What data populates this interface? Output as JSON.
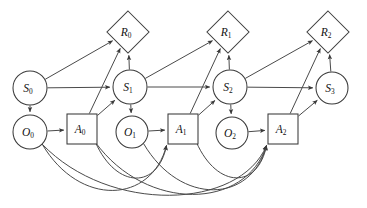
{
  "diagram": {
    "corner_mark": "|",
    "stroke_color": "#4a4a4a",
    "node_fill": "#ffffff",
    "label_color": "#111111",
    "nodes": [
      {
        "id": "S0",
        "base": "S",
        "sub": "0",
        "shape": "circle",
        "cx": 30,
        "cy": 88,
        "r": 17
      },
      {
        "id": "S1",
        "base": "S",
        "sub": "1",
        "shape": "circle",
        "cx": 130,
        "cy": 87,
        "r": 17
      },
      {
        "id": "S2",
        "base": "S",
        "sub": "2",
        "shape": "circle",
        "cx": 230,
        "cy": 87,
        "r": 17
      },
      {
        "id": "S3",
        "base": "S",
        "sub": "3",
        "shape": "circle",
        "cx": 332,
        "cy": 88,
        "r": 16
      },
      {
        "id": "O0",
        "base": "O",
        "sub": "0",
        "shape": "circle",
        "cx": 30,
        "cy": 132,
        "r": 17
      },
      {
        "id": "O1",
        "base": "O",
        "sub": "1",
        "shape": "circle",
        "cx": 132,
        "cy": 132,
        "r": 16
      },
      {
        "id": "O2",
        "base": "O",
        "sub": "2",
        "shape": "circle",
        "cx": 232,
        "cy": 133,
        "r": 16
      },
      {
        "id": "A0",
        "base": "A",
        "sub": "0",
        "shape": "square",
        "cx": 82,
        "cy": 129,
        "r": 15
      },
      {
        "id": "A1",
        "base": "A",
        "sub": "1",
        "shape": "square",
        "cx": 183,
        "cy": 129,
        "r": 15
      },
      {
        "id": "A2",
        "base": "A",
        "sub": "2",
        "shape": "square",
        "cx": 283,
        "cy": 129,
        "r": 15
      },
      {
        "id": "R0",
        "base": "R",
        "sub": "0",
        "shape": "diamond",
        "cx": 128,
        "cy": 32,
        "r": 21
      },
      {
        "id": "R1",
        "base": "R",
        "sub": "1",
        "shape": "diamond",
        "cx": 228,
        "cy": 32,
        "r": 21
      },
      {
        "id": "R2",
        "base": "R",
        "sub": "2",
        "shape": "diamond",
        "cx": 328,
        "cy": 32,
        "r": 21
      }
    ],
    "edges": [
      {
        "from": "S0",
        "to": "S1",
        "kind": "straight"
      },
      {
        "from": "S1",
        "to": "S2",
        "kind": "straight"
      },
      {
        "from": "S2",
        "to": "S3",
        "kind": "straight"
      },
      {
        "from": "S0",
        "to": "O0",
        "kind": "straight"
      },
      {
        "from": "S1",
        "to": "O1",
        "kind": "straight"
      },
      {
        "from": "S2",
        "to": "O2",
        "kind": "straight"
      },
      {
        "from": "O0",
        "to": "A0",
        "kind": "straight"
      },
      {
        "from": "O1",
        "to": "A1",
        "kind": "straight"
      },
      {
        "from": "O2",
        "to": "A2",
        "kind": "straight"
      },
      {
        "from": "A0",
        "to": "S1",
        "kind": "straight"
      },
      {
        "from": "A1",
        "to": "S2",
        "kind": "straight"
      },
      {
        "from": "A2",
        "to": "S3",
        "kind": "straight"
      },
      {
        "from": "S0",
        "to": "R0",
        "kind": "straight"
      },
      {
        "from": "S1",
        "to": "R1",
        "kind": "straight"
      },
      {
        "from": "S2",
        "to": "R2",
        "kind": "straight"
      },
      {
        "from": "A0",
        "to": "R0",
        "kind": "straight"
      },
      {
        "from": "A1",
        "to": "R1",
        "kind": "straight"
      },
      {
        "from": "A2",
        "to": "R2",
        "kind": "straight"
      },
      {
        "from": "S1",
        "to": "R0",
        "kind": "straight"
      },
      {
        "from": "S2",
        "to": "R1",
        "kind": "straight"
      },
      {
        "from": "S3",
        "to": "R2",
        "kind": "straight"
      },
      {
        "from": "O0",
        "to": "A1",
        "kind": "curve"
      },
      {
        "from": "O0",
        "to": "A2",
        "kind": "curve"
      },
      {
        "from": "A0",
        "to": "A1",
        "kind": "curve"
      },
      {
        "from": "A0",
        "to": "A2",
        "kind": "curve"
      },
      {
        "from": "O1",
        "to": "A2",
        "kind": "curve"
      },
      {
        "from": "A1",
        "to": "A2",
        "kind": "curve"
      }
    ],
    "legend": {
      "state_nodes": "S",
      "observation_nodes": "O",
      "action_nodes": "A",
      "reward_nodes": "R",
      "timesteps": [
        "0",
        "1",
        "2",
        "3"
      ]
    }
  }
}
